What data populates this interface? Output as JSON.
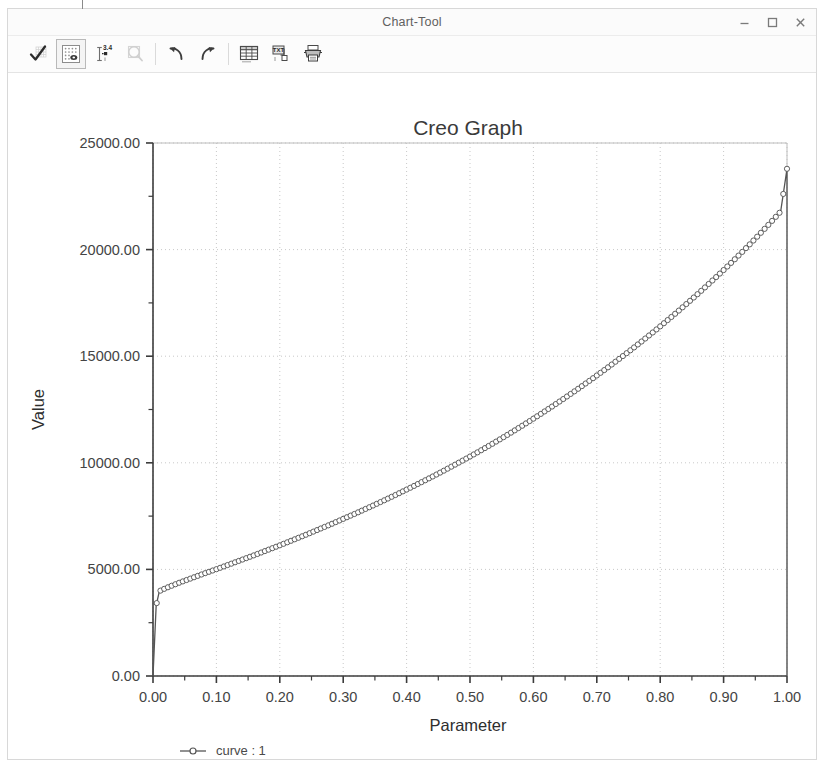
{
  "window": {
    "title": "Chart-Tool",
    "controls": [
      {
        "name": "minimize-button",
        "icon": "minimize-icon",
        "label": "–"
      },
      {
        "name": "maximize-button",
        "icon": "maximize-icon",
        "label": "□"
      },
      {
        "name": "close-button",
        "icon": "close-icon",
        "label": "×"
      }
    ]
  },
  "toolbar": {
    "items": [
      {
        "name": "accept-button",
        "icon": "checkmark-icon",
        "tooltip": "Accept",
        "selected": false,
        "disabled": false
      },
      {
        "name": "show-grid-button",
        "icon": "grid-dots-icon",
        "tooltip": "Show Grid",
        "selected": true,
        "disabled": false
      },
      {
        "name": "axis-scale-button",
        "icon": "axis-scale-icon",
        "tooltip": "Axis Scale",
        "selected": false,
        "disabled": false
      },
      {
        "name": "zoom-button",
        "icon": "magnifier-icon",
        "tooltip": "Zoom",
        "selected": false,
        "disabled": true
      },
      {
        "name": "undo-button",
        "icon": "undo-arrow-icon",
        "tooltip": "Undo",
        "selected": false,
        "disabled": false
      },
      {
        "name": "redo-button",
        "icon": "redo-arrow-icon",
        "tooltip": "Redo",
        "selected": false,
        "disabled": false
      },
      {
        "name": "table-button",
        "icon": "table-icon",
        "tooltip": "Show Table",
        "selected": false,
        "disabled": false
      },
      {
        "name": "export-text-button",
        "icon": "text-export-icon",
        "tooltip": "Export Text",
        "selected": false,
        "disabled": false
      },
      {
        "name": "print-button",
        "icon": "printer-icon",
        "tooltip": "Print",
        "selected": false,
        "disabled": false
      }
    ]
  },
  "chart_data": {
    "type": "line",
    "title": "Creo Graph",
    "xlabel": "Parameter",
    "ylabel": "Value",
    "xlim": [
      0.0,
      1.0
    ],
    "ylim": [
      0.0,
      25000.0
    ],
    "grid": true,
    "legend_position": "bottom-left",
    "x_ticks": [
      0.0,
      0.1,
      0.2,
      0.3,
      0.4,
      0.5,
      0.6,
      0.7,
      0.8,
      0.9,
      1.0
    ],
    "x_tick_labels": [
      "0.00",
      "0.10",
      "0.20",
      "0.30",
      "0.40",
      "0.50",
      "0.60",
      "0.70",
      "0.80",
      "0.90",
      "1.00"
    ],
    "x_minor_step": 0.05,
    "y_ticks": [
      0.0,
      5000.0,
      10000.0,
      15000.0,
      20000.0,
      25000.0
    ],
    "y_tick_labels": [
      "0.00",
      "5000.00",
      "10000.00",
      "15000.00",
      "20000.00",
      "25000.00"
    ],
    "y_minor_step": 2500.0,
    "series": [
      {
        "name": "curve : 1",
        "marker": "circle",
        "line": "solid",
        "color": "#555555",
        "x": [
          0.0,
          0.005,
          0.01,
          0.02,
          0.03,
          0.04,
          0.05,
          0.06,
          0.07,
          0.08,
          0.09,
          0.1,
          0.11,
          0.12,
          0.13,
          0.14,
          0.15,
          0.16,
          0.17,
          0.18,
          0.19,
          0.2,
          0.21,
          0.22,
          0.23,
          0.24,
          0.25,
          0.26,
          0.27,
          0.28,
          0.29,
          0.3,
          0.31,
          0.32,
          0.33,
          0.34,
          0.35,
          0.36,
          0.37,
          0.38,
          0.39,
          0.4,
          0.41,
          0.42,
          0.43,
          0.44,
          0.45,
          0.46,
          0.47,
          0.48,
          0.49,
          0.5,
          0.51,
          0.52,
          0.53,
          0.54,
          0.55,
          0.56,
          0.57,
          0.58,
          0.59,
          0.6,
          0.61,
          0.62,
          0.63,
          0.64,
          0.65,
          0.66,
          0.67,
          0.68,
          0.69,
          0.7,
          0.71,
          0.72,
          0.73,
          0.74,
          0.75,
          0.76,
          0.77,
          0.78,
          0.79,
          0.8,
          0.81,
          0.82,
          0.83,
          0.84,
          0.85,
          0.86,
          0.87,
          0.88,
          0.89,
          0.9,
          0.91,
          0.92,
          0.93,
          0.94,
          0.95,
          0.96,
          0.97,
          0.98,
          0.99,
          1.0,
          1.0
        ],
        "y": [
          0,
          3300,
          3980,
          4120,
          4240,
          4360,
          4470,
          4580,
          4690,
          4800,
          4905,
          5010,
          5120,
          5230,
          5340,
          5450,
          5560,
          5670,
          5785,
          5900,
          6015,
          6130,
          6250,
          6370,
          6490,
          6610,
          6735,
          6860,
          6985,
          7110,
          7240,
          7370,
          7500,
          7630,
          7765,
          7900,
          8035,
          8175,
          8315,
          8455,
          8600,
          8745,
          8890,
          9040,
          9190,
          9340,
          9495,
          9650,
          9810,
          9970,
          10130,
          10295,
          10460,
          10630,
          10800,
          10975,
          11150,
          11330,
          11510,
          11695,
          11880,
          12070,
          12260,
          12455,
          12650,
          12850,
          13050,
          13255,
          13460,
          13670,
          13880,
          14095,
          14310,
          14530,
          14755,
          14980,
          15210,
          15440,
          15675,
          15915,
          16155,
          16400,
          16650,
          16900,
          17155,
          17415,
          17675,
          17940,
          18210,
          18485,
          18760,
          19040,
          19325,
          19615,
          19910,
          20210,
          20515,
          20825,
          21140,
          21460,
          21785,
          23790,
          0
        ]
      }
    ]
  },
  "legend": {
    "entries": [
      {
        "label": "curve : 1",
        "marker": "circle",
        "color": "#555555"
      }
    ]
  }
}
